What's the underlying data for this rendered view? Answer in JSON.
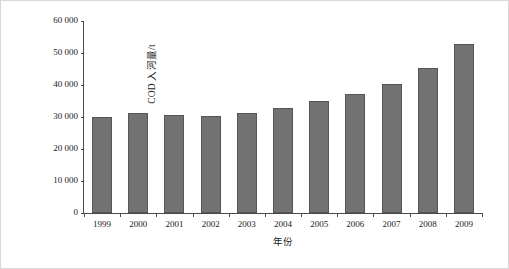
{
  "chart_data": {
    "type": "bar",
    "title": "",
    "xlabel": "年份",
    "ylabel": "COD 入河量/t",
    "categories": [
      "1999",
      "2000",
      "2001",
      "2002",
      "2003",
      "2004",
      "2005",
      "2006",
      "2007",
      "2008",
      "2009"
    ],
    "values": [
      30100,
      31200,
      30500,
      30200,
      31100,
      32900,
      35100,
      37200,
      40300,
      45300,
      52800
    ],
    "ylim": [
      0,
      60000
    ],
    "ytick_values": [
      0,
      10000,
      20000,
      30000,
      40000,
      50000,
      60000
    ],
    "ytick_labels": [
      "0",
      "10 000",
      "20 000",
      "30 000",
      "40 000",
      "50 000",
      "60 000"
    ],
    "grid": false,
    "legend": null,
    "series": [
      {
        "name": "COD 入河量",
        "color": "#727272",
        "values": [
          30100,
          31200,
          30500,
          30200,
          31100,
          32900,
          35100,
          37200,
          40300,
          45300,
          52800
        ]
      }
    ],
    "colors": {
      "bar_fill": "#727272",
      "bar_border": "#565656",
      "axis": "#4a4a4a",
      "text": "#1a1a1a",
      "background": "#ffffff",
      "frame_border": "#d8d8d8"
    }
  }
}
